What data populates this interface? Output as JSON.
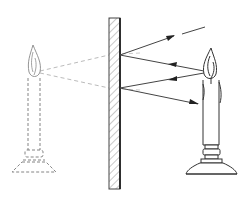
{
  "figure": {
    "width": 251,
    "height": 197,
    "colors": {
      "background": "#ffffff",
      "ink": "#333333",
      "ray": "#555555",
      "virtual_ray": "#bbbbbb",
      "virtual_object": "#777777"
    }
  },
  "elements": {
    "mirror": {
      "label": "plane mirror",
      "x": 109,
      "y": 18,
      "width": 11,
      "height": 171,
      "reflecting_face": "right"
    },
    "real_candle": {
      "label": "candle (object)",
      "flame_tip": [
        207,
        48
      ],
      "flame_center": [
        207,
        72
      ],
      "base_y": 180
    },
    "virtual_candle": {
      "label": "candle image (virtual)",
      "flame_center": [
        35,
        72
      ],
      "base_y": 172,
      "style": "dashed"
    },
    "rays": [
      {
        "name": "incident-ray-upper",
        "from": [
          207,
          72
        ],
        "to": [
          120,
          55
        ],
        "arrow": "left"
      },
      {
        "name": "incident-ray-lower",
        "from": [
          207,
          72
        ],
        "to": [
          120,
          88
        ],
        "arrow": "left"
      },
      {
        "name": "reflected-ray-upper",
        "from": [
          120,
          55
        ],
        "to": [
          172,
          36
        ],
        "arrow": "right",
        "continuation": [
          [
            182,
            34
          ],
          [
            205,
            27
          ]
        ]
      },
      {
        "name": "reflected-ray-lower",
        "from": [
          120,
          88
        ],
        "to": [
          198,
          104
        ],
        "arrow": "right"
      }
    ],
    "virtual_rays": [
      {
        "name": "virtual-ray-upper",
        "from": [
          35,
          72
        ],
        "to": [
          120,
          55
        ]
      },
      {
        "name": "virtual-ray-lower",
        "from": [
          35,
          72
        ],
        "to": [
          120,
          88
        ]
      }
    ]
  }
}
